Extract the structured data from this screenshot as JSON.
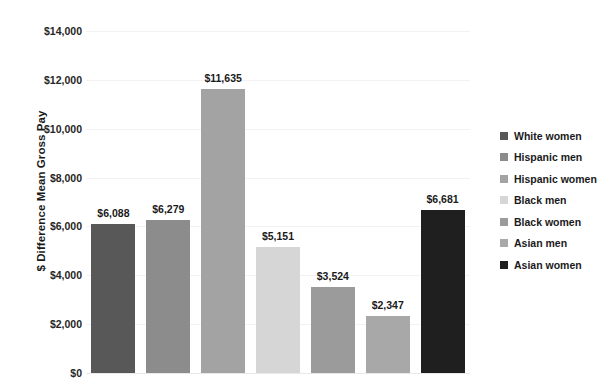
{
  "chart_data": {
    "type": "bar",
    "title": "",
    "xlabel": "",
    "ylabel": "$ Difference Mean Gross Pay",
    "ylim": [
      0,
      14000
    ],
    "ytick_step": 2000,
    "ytick_labels": [
      "$14,000",
      "$12,000",
      "$10,000",
      "$8,000",
      "$6,000",
      "$4,000",
      "$2,000",
      "$0"
    ],
    "ytick_values": [
      14000,
      12000,
      10000,
      8000,
      6000,
      4000,
      2000,
      0
    ],
    "grid": true,
    "legend_position": "right",
    "categories": [
      "White women",
      "Hispanic men",
      "Hispanic women",
      "Black men",
      "Black women",
      "Asian men",
      "Asian women"
    ],
    "values": [
      6088,
      6279,
      11635,
      5151,
      3524,
      2347,
      6681
    ],
    "data_labels": [
      "$6,088",
      "$6,279",
      "$11,635",
      "$5,151",
      "$3,524",
      "$2,347",
      "$6,681"
    ],
    "colors": [
      "#585858",
      "#8c8c8c",
      "#a3a3a3",
      "#d6d6d6",
      "#9b9b9b",
      "#a8a8a8",
      "#1f1f1f"
    ],
    "bars": [
      {
        "category": "White women",
        "value": 6088,
        "label": "$6,088",
        "color": "#585858"
      },
      {
        "category": "Hispanic men",
        "value": 6279,
        "label": "$6,279",
        "color": "#8c8c8c"
      },
      {
        "category": "Hispanic women",
        "value": 11635,
        "label": "$11,635",
        "color": "#a3a3a3"
      },
      {
        "category": "Black men",
        "value": 5151,
        "label": "$5,151",
        "color": "#d6d6d6"
      },
      {
        "category": "Black women",
        "value": 3524,
        "label": "$3,524",
        "color": "#9b9b9b"
      },
      {
        "category": "Asian men",
        "value": 2347,
        "label": "$2,347",
        "color": "#a8a8a8"
      },
      {
        "category": "Asian women",
        "value": 6681,
        "label": "$6,681",
        "color": "#1f1f1f"
      }
    ],
    "legend": [
      {
        "label": "White women",
        "color": "#585858"
      },
      {
        "label": "Hispanic men",
        "color": "#8c8c8c"
      },
      {
        "label": "Hispanic women",
        "color": "#a3a3a3"
      },
      {
        "label": "Black men",
        "color": "#d6d6d6"
      },
      {
        "label": "Black women",
        "color": "#9b9b9b"
      },
      {
        "label": "Asian men",
        "color": "#a8a8a8"
      },
      {
        "label": "Asian women",
        "color": "#1f1f1f"
      }
    ]
  }
}
